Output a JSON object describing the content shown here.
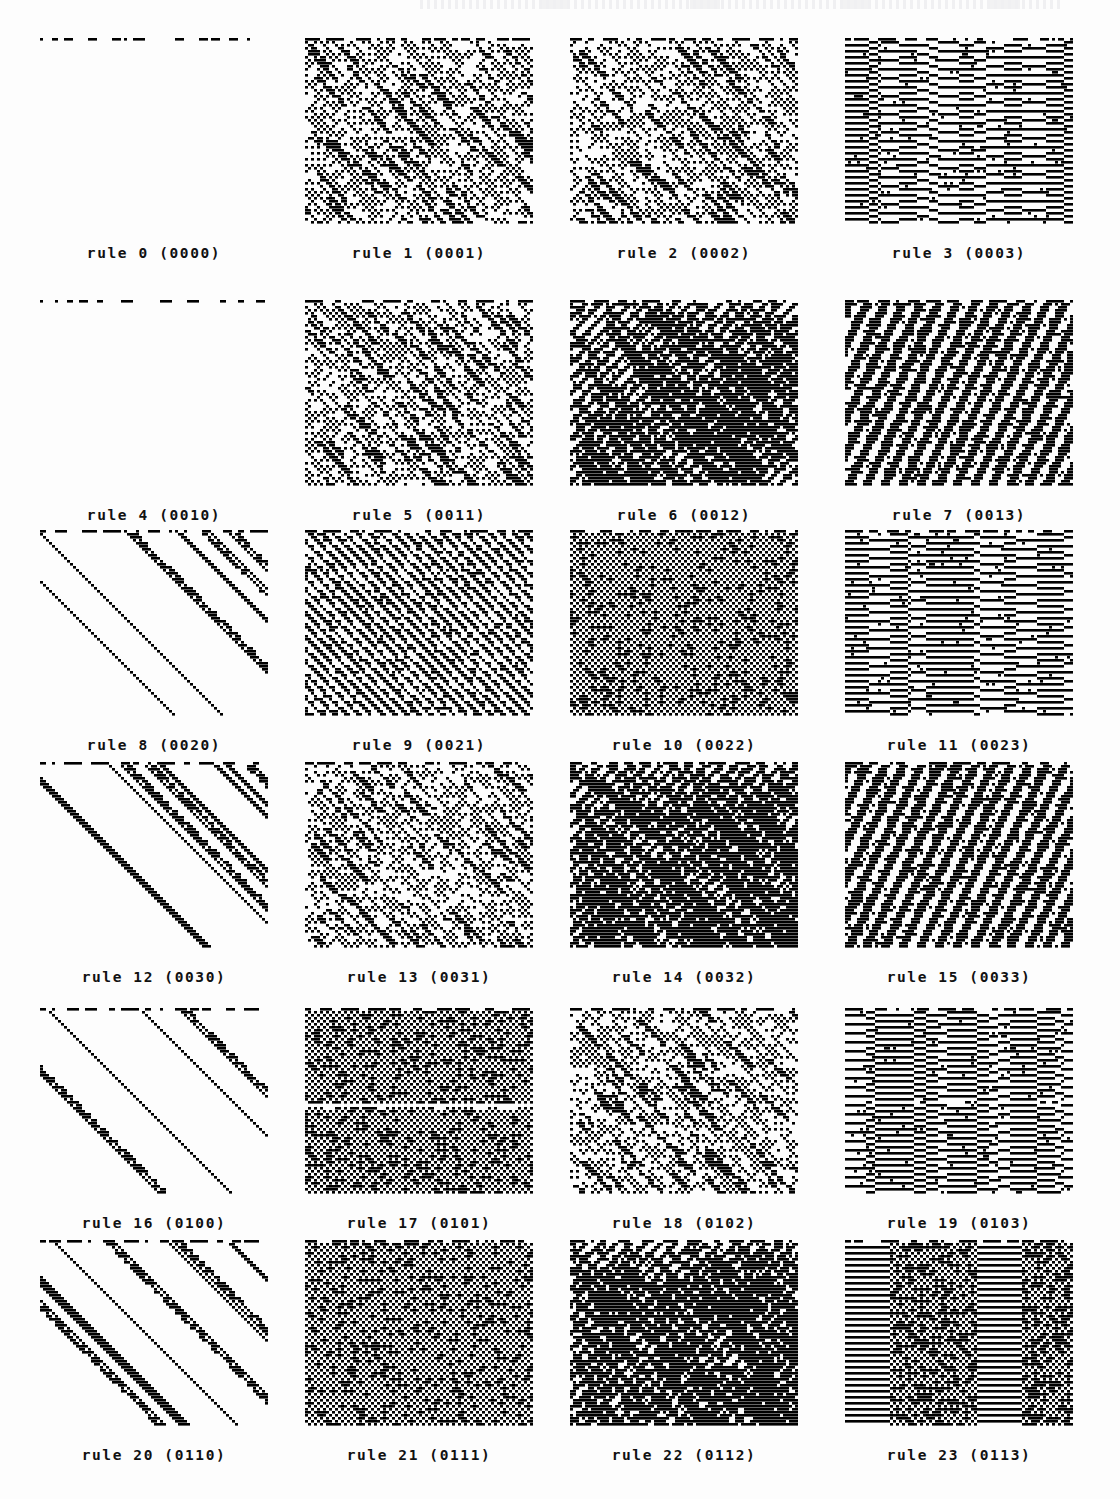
{
  "figure": {
    "type": "cellular-automaton-atlas",
    "columns": 4,
    "rows": 6,
    "panel_count": 24,
    "ink_color": "#000000",
    "paper_color": "#fdfdfd",
    "caption_format": "rule N (CODE)"
  },
  "layout": {
    "panel_width": 228,
    "panel_height": 186,
    "col_x": [
      40,
      305,
      570,
      845
    ],
    "row_y": [
      38,
      300,
      530,
      762,
      1008,
      1240
    ],
    "caption_offset": 42
  },
  "panels": [
    {
      "index": 0,
      "rule": 0,
      "code": "0000",
      "caption": "rule 0 (0000)",
      "kind": "empty",
      "density": 0.0,
      "seed": 1101
    },
    {
      "index": 1,
      "rule": 1,
      "code": "0001",
      "caption": "rule 1 (0001)",
      "kind": "dots-diag",
      "density": 0.33,
      "seed": 1211
    },
    {
      "index": 2,
      "rule": 2,
      "code": "0002",
      "caption": "rule 2 (0002)",
      "kind": "dots-diag",
      "density": 0.31,
      "seed": 1322
    },
    {
      "index": 3,
      "rule": 3,
      "code": "0003",
      "caption": "rule 3 (0003)",
      "kind": "vstripe",
      "density": 0.52,
      "seed": 1433
    },
    {
      "index": 4,
      "rule": 4,
      "code": "0010",
      "caption": "rule 4 (0010)",
      "kind": "empty",
      "density": 0.0,
      "seed": 1544
    },
    {
      "index": 5,
      "rule": 5,
      "code": "0011",
      "caption": "rule 5 (0011)",
      "kind": "dots-diag",
      "density": 0.34,
      "seed": 1655
    },
    {
      "index": 6,
      "rule": 6,
      "code": "0012",
      "caption": "rule 6 (0012)",
      "kind": "dense-diag",
      "density": 0.47,
      "seed": 1766
    },
    {
      "index": 7,
      "rule": 7,
      "code": "0013",
      "caption": "rule 7 (0013)",
      "kind": "stepped",
      "density": 0.5,
      "seed": 1877
    },
    {
      "index": 8,
      "rule": 8,
      "code": "0020",
      "caption": "rule 8 (0020)",
      "kind": "diag-bands",
      "density": 0.3,
      "seed": 1988
    },
    {
      "index": 9,
      "rule": 9,
      "code": "0021",
      "caption": "rule 9 (0021)",
      "kind": "fine-diag",
      "density": 0.4,
      "seed": 2099
    },
    {
      "index": 10,
      "rule": 10,
      "code": "0022",
      "caption": "rule 10 (0022)",
      "kind": "checker",
      "density": 0.62,
      "seed": 2110
    },
    {
      "index": 11,
      "rule": 11,
      "code": "0023",
      "caption": "rule 11 (0023)",
      "kind": "vstripe",
      "density": 0.55,
      "seed": 2221
    },
    {
      "index": 12,
      "rule": 12,
      "code": "0030",
      "caption": "rule 12 (0030)",
      "kind": "diag-bands",
      "density": 0.28,
      "seed": 2332
    },
    {
      "index": 13,
      "rule": 13,
      "code": "0031",
      "caption": "rule 13 (0031)",
      "kind": "dots-diag",
      "density": 0.3,
      "seed": 2443
    },
    {
      "index": 14,
      "rule": 14,
      "code": "0032",
      "caption": "rule 14 (0032)",
      "kind": "dense-diag",
      "density": 0.54,
      "seed": 2554
    },
    {
      "index": 15,
      "rule": 15,
      "code": "0033",
      "caption": "rule 15 (0033)",
      "kind": "stepped",
      "density": 0.53,
      "seed": 2665
    },
    {
      "index": 16,
      "rule": 16,
      "code": "0100",
      "caption": "rule 16 (0100)",
      "kind": "diag-bands",
      "density": 0.26,
      "seed": 2776
    },
    {
      "index": 17,
      "rule": 17,
      "code": "0101",
      "caption": "rule 17 (0101)",
      "kind": "checker",
      "density": 0.66,
      "seed": 2887,
      "band": 0.52
    },
    {
      "index": 18,
      "rule": 18,
      "code": "0102",
      "caption": "rule 18 (0102)",
      "kind": "dots-diag",
      "density": 0.31,
      "seed": 2998
    },
    {
      "index": 19,
      "rule": 19,
      "code": "0103",
      "caption": "rule 19 (0103)",
      "kind": "vstripe",
      "density": 0.58,
      "seed": 3109,
      "band": 0.5
    },
    {
      "index": 20,
      "rule": 20,
      "code": "0110",
      "caption": "rule 20 (0110)",
      "kind": "diag-bands",
      "density": 0.33,
      "seed": 3210
    },
    {
      "index": 21,
      "rule": 21,
      "code": "0111",
      "caption": "rule 21 (0111)",
      "kind": "checker",
      "density": 0.64,
      "seed": 3321
    },
    {
      "index": 22,
      "rule": 22,
      "code": "0112",
      "caption": "rule 22 (0112)",
      "kind": "dense-diag",
      "density": 0.56,
      "seed": 3432
    },
    {
      "index": 23,
      "rule": 23,
      "code": "0113",
      "caption": "rule 23 (0113)",
      "kind": "mixed-vh",
      "density": 0.57,
      "seed": 3543
    }
  ],
  "chart_data": {
    "type": "heatmap",
    "title": "",
    "xlabel": "",
    "ylabel": "",
    "legend": [],
    "grid": false,
    "note": "24 space-time diagrams of one-dimensional cellular automata; horizontal axis = cell site, vertical axis = successive time steps downward",
    "categories": [
      "rule 0 (0000)",
      "rule 1 (0001)",
      "rule 2 (0002)",
      "rule 3 (0003)",
      "rule 4 (0010)",
      "rule 5 (0011)",
      "rule 6 (0012)",
      "rule 7 (0013)",
      "rule 8 (0020)",
      "rule 9 (0021)",
      "rule 10 (0022)",
      "rule 11 (0023)",
      "rule 12 (0030)",
      "rule 13 (0031)",
      "rule 14 (0032)",
      "rule 15 (0033)",
      "rule 16 (0100)",
      "rule 17 (0101)",
      "rule 18 (0102)",
      "rule 19 (0103)",
      "rule 20 (0110)",
      "rule 21 (0111)",
      "rule 22 (0112)",
      "rule 23 (0113)"
    ],
    "values": [
      0.0,
      0.33,
      0.31,
      0.52,
      0.0,
      0.34,
      0.47,
      0.5,
      0.3,
      0.4,
      0.62,
      0.55,
      0.28,
      0.3,
      0.54,
      0.53,
      0.26,
      0.66,
      0.31,
      0.58,
      0.33,
      0.64,
      0.56,
      0.57
    ],
    "ylim": [
      0,
      1
    ]
  }
}
